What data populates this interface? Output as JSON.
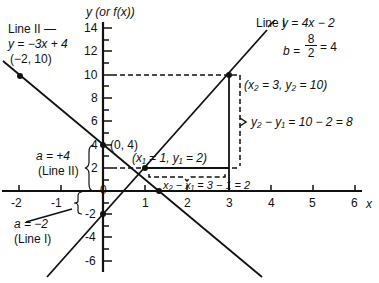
{
  "axes": {
    "y_label": "y (or f(x))",
    "x_label": "x",
    "x_ticks": [
      "-2",
      "-1",
      "0",
      "1",
      "2",
      "3",
      "4",
      "5",
      "6"
    ],
    "y_ticks": [
      "14",
      "12",
      "10",
      "8",
      "6",
      "4",
      "2",
      "-2",
      "-4",
      "-6"
    ]
  },
  "line_1": {
    "name": "Line I",
    "equation": "y = 4x − 2",
    "slope_label": "b = 8/2 = 4",
    "slope_num": "8",
    "slope_den": "2",
    "slope_result": "= 4",
    "intercept_label": "a = −2",
    "intercept_line": "(Line I)"
  },
  "line_2": {
    "name": "Line II —",
    "equation": "y = −3x + 4",
    "point": "(−2, 10)",
    "intercept_label": "a = +4",
    "intercept_line": "(Line II)",
    "intercept_point": "(0, 4)"
  },
  "annotations": {
    "p1": "(x₁ = 1, y₁ = 2)",
    "p2": "(x₂ = 3, y₂ = 10)",
    "rise": "y₂ − y₁ = 10 − 2 = 8",
    "run": "x₂ − x₁ = 3 − 1 = 2"
  },
  "colors": {
    "ink": "#111111",
    "background": "#ffffff"
  }
}
